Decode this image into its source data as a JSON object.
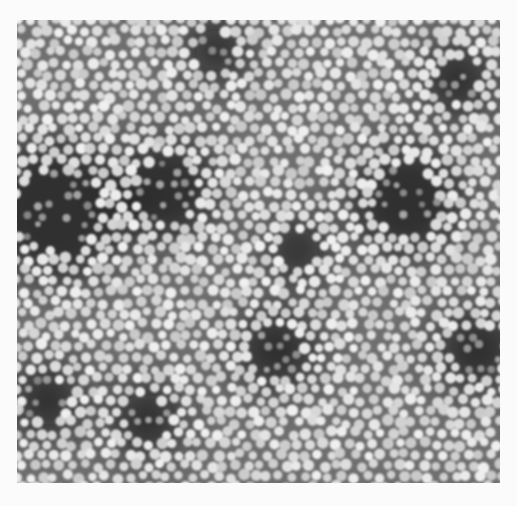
{
  "image": {
    "kind": "electron-micrograph",
    "description": "Densely packed spherical particles, light on gray background with darker aggregate regions",
    "colors": {
      "page_background": "#fbfbfb",
      "field_background": "#6f6f6f",
      "particle": "#d9d9d9",
      "dark_region": "#1e1e1e"
    },
    "dark_regions": [
      {
        "cx": 40,
        "cy": 190,
        "r": 75
      },
      {
        "cx": 150,
        "cy": 170,
        "r": 55
      },
      {
        "cx": 390,
        "cy": 180,
        "r": 60
      },
      {
        "cx": 200,
        "cy": 30,
        "r": 35
      },
      {
        "cx": 440,
        "cy": 60,
        "r": 40
      },
      {
        "cx": 260,
        "cy": 330,
        "r": 45
      },
      {
        "cx": 130,
        "cy": 400,
        "r": 40
      },
      {
        "cx": 30,
        "cy": 380,
        "r": 40
      },
      {
        "cx": 460,
        "cy": 330,
        "r": 45
      },
      {
        "cx": 280,
        "cy": 230,
        "r": 35
      }
    ],
    "particle_radius": 5.2,
    "particle_spacing": 12.5
  }
}
